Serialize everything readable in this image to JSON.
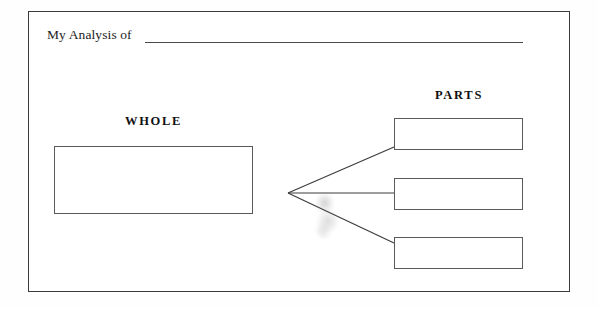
{
  "worksheet": {
    "title_prefix": "My Analysis of",
    "title_fill_value": "",
    "headings": {
      "whole": "WHOLE",
      "parts": "PARTS"
    },
    "whole_box": {
      "label": "whole-answer-box",
      "value": ""
    },
    "part_boxes": [
      {
        "label": "part-answer-box-1",
        "value": ""
      },
      {
        "label": "part-answer-box-2",
        "value": ""
      },
      {
        "label": "part-answer-box-3",
        "value": ""
      }
    ],
    "connector": {
      "vertex_x": 288,
      "vertex_y": 193,
      "branch_count": 3
    },
    "colors": {
      "page_background": "#ffffff",
      "frame_stroke": "#3a3a3a",
      "box_stroke": "#5a5a5a",
      "rule_stroke": "#4a4a4a",
      "text": "#111111",
      "smudge": "#8a8a8a"
    }
  }
}
